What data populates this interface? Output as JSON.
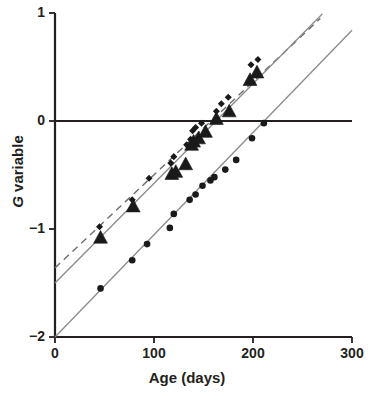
{
  "chart_data": {
    "type": "scatter",
    "title": "",
    "subtitle": "",
    "xlabel": "Age (days)",
    "ylabel": "G variable",
    "ylabel_italic_prefix": "G",
    "ylabel_rest": " variable",
    "xlim": [
      0,
      300
    ],
    "ylim": [
      -2,
      1
    ],
    "xticks": [
      0,
      100,
      200,
      300
    ],
    "xtick_labels": [
      "0",
      "100",
      "200",
      "300"
    ],
    "yticks": [
      1,
      0,
      -1,
      -2
    ],
    "ytick_labels": [
      "1",
      "0",
      "−1",
      "−2"
    ],
    "grid": false,
    "legend": "none",
    "zero_line": {
      "y": 0,
      "from_x": 0,
      "to_x": 300,
      "style": "solid",
      "width": 2.2
    },
    "series": [
      {
        "name": "small-dot-series",
        "marker": "small-dot",
        "color": "#1a1a1a",
        "marker_size": 4.2,
        "fit_line": {
          "style": "dashed",
          "color": "#6e6e6e",
          "width": 1.4,
          "x0": 0,
          "y0": -1.36,
          "x1": 268,
          "y1": 0.95
        },
        "points": [
          {
            "x": 45,
            "y": -0.98
          },
          {
            "x": 78,
            "y": -0.73
          },
          {
            "x": 95,
            "y": -0.53
          },
          {
            "x": 117,
            "y": -0.39
          },
          {
            "x": 120,
            "y": -0.33
          },
          {
            "x": 133,
            "y": -0.22
          },
          {
            "x": 137,
            "y": -0.17
          },
          {
            "x": 139,
            "y": -0.09
          },
          {
            "x": 142,
            "y": -0.06
          },
          {
            "x": 148,
            "y": -0.02
          },
          {
            "x": 163,
            "y": 0.09
          },
          {
            "x": 168,
            "y": 0.16
          },
          {
            "x": 175,
            "y": 0.22
          },
          {
            "x": 198,
            "y": 0.52
          },
          {
            "x": 205,
            "y": 0.57
          }
        ]
      },
      {
        "name": "triangle-series",
        "marker": "triangle",
        "color": "#1a1a1a",
        "marker_size": 7.5,
        "fit_line": {
          "style": "solid",
          "color": "#8a8a8a",
          "width": 1.3,
          "x0": 0,
          "y0": -1.5,
          "x1": 270,
          "y1": 0.99
        },
        "points": [
          {
            "x": 46,
            "y": -1.08
          },
          {
            "x": 79,
            "y": -0.79
          },
          {
            "x": 118,
            "y": -0.49
          },
          {
            "x": 122,
            "y": -0.47
          },
          {
            "x": 132,
            "y": -0.4
          },
          {
            "x": 138,
            "y": -0.22
          },
          {
            "x": 140,
            "y": -0.19
          },
          {
            "x": 145,
            "y": -0.16
          },
          {
            "x": 152,
            "y": -0.1
          },
          {
            "x": 163,
            "y": 0.02
          },
          {
            "x": 176,
            "y": 0.09
          },
          {
            "x": 197,
            "y": 0.38
          },
          {
            "x": 204,
            "y": 0.45
          }
        ]
      },
      {
        "name": "filled-circle-series",
        "marker": "circle",
        "color": "#1a1a1a",
        "marker_size": 6.6,
        "fit_line": {
          "style": "solid",
          "color": "#8a8a8a",
          "width": 1.3,
          "x0": 0,
          "y0": -2.0,
          "x1": 300,
          "y1": 0.84
        },
        "points": [
          {
            "x": 46,
            "y": -1.55
          },
          {
            "x": 78,
            "y": -1.29
          },
          {
            "x": 93,
            "y": -1.14
          },
          {
            "x": 116,
            "y": -0.99
          },
          {
            "x": 120,
            "y": -0.86
          },
          {
            "x": 136,
            "y": -0.73
          },
          {
            "x": 142,
            "y": -0.68
          },
          {
            "x": 149,
            "y": -0.6
          },
          {
            "x": 157,
            "y": -0.55
          },
          {
            "x": 161,
            "y": -0.52
          },
          {
            "x": 172,
            "y": -0.45
          },
          {
            "x": 183,
            "y": -0.36
          },
          {
            "x": 199,
            "y": -0.16
          },
          {
            "x": 211,
            "y": -0.02
          }
        ]
      }
    ]
  }
}
